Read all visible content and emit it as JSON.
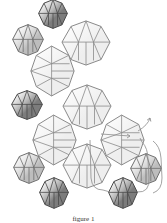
{
  "diagram": {
    "caption": "figure 1",
    "colors": {
      "light_bead_fill": "#eeeeee",
      "light_bead_stroke": "#8a8a8a",
      "medium_bead_fill": "#bdbdbd",
      "medium_bead_stroke": "#6e6e6e",
      "dark_bead_fill": "#7c7c7c",
      "dark_bead_stroke": "#4a4a4a",
      "thread": "#8c8c8c"
    },
    "beads": [
      {
        "id": "dark-top",
        "tone": "dark",
        "cx": 53,
        "cy": 14,
        "w": 30,
        "h": 30,
        "orient": "v"
      },
      {
        "id": "medium-top-left",
        "tone": "medium",
        "cx": 28,
        "cy": 40,
        "w": 32,
        "h": 32,
        "orient": "v"
      },
      {
        "id": "large-top-right",
        "tone": "light",
        "cx": 86,
        "cy": 43,
        "w": 50,
        "h": 46,
        "orient": "v"
      },
      {
        "id": "large-mid-left",
        "tone": "light",
        "cx": 52,
        "cy": 71,
        "w": 45,
        "h": 52,
        "orient": "h"
      },
      {
        "id": "dark-left",
        "tone": "dark",
        "cx": 27,
        "cy": 105,
        "w": 32,
        "h": 30,
        "orient": "v"
      },
      {
        "id": "large-center",
        "tone": "light",
        "cx": 87,
        "cy": 107,
        "w": 50,
        "h": 46,
        "orient": "v"
      },
      {
        "id": "large-lower-left",
        "tone": "light",
        "cx": 54,
        "cy": 140,
        "w": 45,
        "h": 52,
        "orient": "h"
      },
      {
        "id": "large-right",
        "tone": "light",
        "cx": 122,
        "cy": 140,
        "w": 45,
        "h": 52,
        "orient": "h"
      },
      {
        "id": "large-bottom-center",
        "tone": "light",
        "cx": 87,
        "cy": 166,
        "w": 50,
        "h": 46,
        "orient": "v"
      },
      {
        "id": "medium-lower-left",
        "tone": "medium",
        "cx": 29,
        "cy": 168,
        "w": 32,
        "h": 32,
        "orient": "v"
      },
      {
        "id": "medium-right",
        "tone": "medium",
        "cx": 146,
        "cy": 169,
        "w": 32,
        "h": 32,
        "orient": "v"
      },
      {
        "id": "dark-bottom-left",
        "tone": "dark",
        "cx": 54,
        "cy": 193,
        "w": 30,
        "h": 32,
        "orient": "v"
      },
      {
        "id": "dark-bottom-right",
        "tone": "dark",
        "cx": 123,
        "cy": 193,
        "w": 30,
        "h": 32,
        "orient": "v"
      }
    ],
    "thread_path": "M 101 134 L 130 136 M 90 140 L 91 178 Q 92 190 103 190 L 110 192 M 137 192 Q 150 193 149 178 L 148 160 Q 148 148 142 142 L 140 138 M 153 141 Q 160 146 161 158 L 162 178 Q 162 190 153 193 M 138 131 Q 148 125 150 118",
    "arrows": [
      {
        "x": 130,
        "y": 136,
        "angle": 0
      },
      {
        "x": 150,
        "y": 118,
        "angle": -70
      }
    ]
  }
}
